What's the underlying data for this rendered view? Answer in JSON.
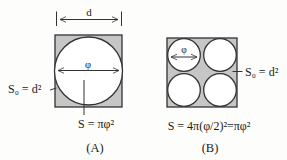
{
  "palette": {
    "shaded_fill": "#c6c6c6",
    "circle_fill": "#ffffff",
    "line_color": "#333333",
    "background": "#fdfdfb"
  },
  "figure_a": {
    "caption": "(A)",
    "width_dim_label": "d",
    "diameter_label": "φ",
    "square_area_label": "S₀ = d²",
    "circle_area_label": "S = πφ²"
  },
  "figure_b": {
    "caption": "(B)",
    "diameter_label": "φ",
    "square_area_label": "S₀ = d²",
    "circles_area_label": "S = 4π(φ/2)²=πφ²"
  }
}
